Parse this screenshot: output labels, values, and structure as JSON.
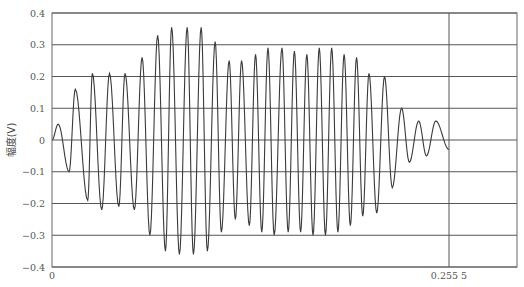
{
  "chart_data": {
    "type": "line",
    "title": "",
    "xlabel": "",
    "ylabel": "幅度(V)",
    "ylim": [
      -0.4,
      0.4
    ],
    "yticks": [
      "0.4",
      "0.3",
      "0.2",
      "0.1",
      "0",
      "-0.1",
      "-0.2",
      "-0.3",
      "-0.4"
    ],
    "xticks": [
      {
        "label": "0",
        "value": 0
      },
      {
        "label": "0.255 5",
        "value": 0.2555
      }
    ],
    "marker_line_x": 0.2555,
    "grid": "horizontal",
    "series": [
      {
        "name": "signal",
        "color": "#333333",
        "description": "Amplitude-modulated oscillation: envelope grows from 0 to ~0.355 V near t≈0.09, dips to ~0.25, plateaus ~0.28, then decays to ~0.05 by t=0.2555",
        "extrema": [
          {
            "x": 0.0,
            "y": 0.0
          },
          {
            "x": 0.004,
            "y": 0.05
          },
          {
            "x": 0.011,
            "y": -0.1
          },
          {
            "x": 0.015,
            "y": 0.16
          },
          {
            "x": 0.023,
            "y": -0.19
          },
          {
            "x": 0.026,
            "y": 0.21
          },
          {
            "x": 0.032,
            "y": -0.22
          },
          {
            "x": 0.037,
            "y": 0.21
          },
          {
            "x": 0.043,
            "y": -0.21
          },
          {
            "x": 0.047,
            "y": 0.21
          },
          {
            "x": 0.053,
            "y": -0.22
          },
          {
            "x": 0.058,
            "y": 0.26
          },
          {
            "x": 0.063,
            "y": -0.3
          },
          {
            "x": 0.068,
            "y": 0.33
          },
          {
            "x": 0.073,
            "y": -0.35
          },
          {
            "x": 0.077,
            "y": 0.355
          },
          {
            "x": 0.082,
            "y": -0.36
          },
          {
            "x": 0.087,
            "y": 0.355
          },
          {
            "x": 0.091,
            "y": -0.36
          },
          {
            "x": 0.096,
            "y": 0.355
          },
          {
            "x": 0.1,
            "y": -0.35
          },
          {
            "x": 0.105,
            "y": 0.31
          },
          {
            "x": 0.109,
            "y": -0.29
          },
          {
            "x": 0.114,
            "y": 0.25
          },
          {
            "x": 0.118,
            "y": -0.25
          },
          {
            "x": 0.122,
            "y": 0.25
          },
          {
            "x": 0.127,
            "y": -0.27
          },
          {
            "x": 0.131,
            "y": 0.27
          },
          {
            "x": 0.135,
            "y": -0.29
          },
          {
            "x": 0.139,
            "y": 0.29
          },
          {
            "x": 0.143,
            "y": -0.3
          },
          {
            "x": 0.148,
            "y": 0.29
          },
          {
            "x": 0.152,
            "y": -0.29
          },
          {
            "x": 0.156,
            "y": 0.28
          },
          {
            "x": 0.16,
            "y": -0.29
          },
          {
            "x": 0.164,
            "y": 0.27
          },
          {
            "x": 0.168,
            "y": -0.3
          },
          {
            "x": 0.172,
            "y": 0.29
          },
          {
            "x": 0.176,
            "y": -0.3
          },
          {
            "x": 0.18,
            "y": 0.29
          },
          {
            "x": 0.184,
            "y": -0.29
          },
          {
            "x": 0.188,
            "y": 0.27
          },
          {
            "x": 0.192,
            "y": -0.27
          },
          {
            "x": 0.196,
            "y": 0.26
          },
          {
            "x": 0.2,
            "y": -0.24
          },
          {
            "x": 0.204,
            "y": 0.21
          },
          {
            "x": 0.209,
            "y": -0.23
          },
          {
            "x": 0.214,
            "y": 0.2
          },
          {
            "x": 0.219,
            "y": -0.15
          },
          {
            "x": 0.225,
            "y": 0.1
          },
          {
            "x": 0.23,
            "y": -0.07
          },
          {
            "x": 0.236,
            "y": 0.06
          },
          {
            "x": 0.241,
            "y": -0.05
          },
          {
            "x": 0.247,
            "y": 0.06
          },
          {
            "x": 0.2555,
            "y": -0.03
          }
        ]
      }
    ]
  },
  "axes": {
    "ylabel": "幅度(V)",
    "x_start_label": "0",
    "x_marker_label": "0.255 5"
  }
}
